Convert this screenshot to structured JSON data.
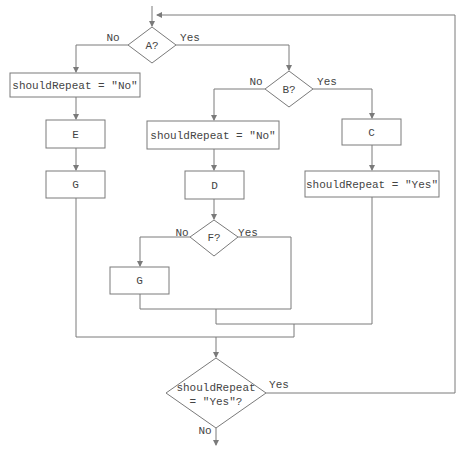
{
  "diagram": {
    "type": "flowchart",
    "colors": {
      "line": "#7a7a7a",
      "text": "#444444",
      "background": "#ffffff"
    },
    "decisions": {
      "a": {
        "label": "A?",
        "yes": "Yes",
        "no": "No"
      },
      "b": {
        "label": "B?",
        "yes": "Yes",
        "no": "No"
      },
      "f": {
        "label": "F?",
        "yes": "Yes",
        "no": "No"
      },
      "final": {
        "line1": "shouldRepeat",
        "line2": "= \"Yes\"?",
        "yes": "Yes",
        "no": "No"
      }
    },
    "processes": {
      "left_should_repeat": "shouldRepeat = \"No\"",
      "e": "E",
      "g_left": "G",
      "mid_should_repeat": "shouldRepeat = \"No\"",
      "d": "D",
      "g_mid": "G",
      "c": "C",
      "right_should_repeat": "shouldRepeat = \"Yes\""
    }
  }
}
